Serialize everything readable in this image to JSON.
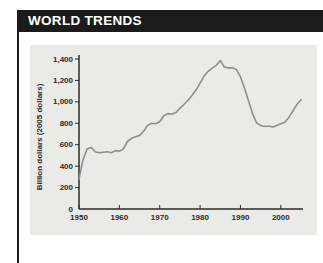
{
  "header": {
    "title": "WORLD TRENDS",
    "bg_color": "#1b1b1b",
    "text_color": "#ffffff"
  },
  "chart_data": {
    "type": "line",
    "title": "",
    "xlabel": "",
    "ylabel": "Billion dollars (2005 dollars)",
    "xlim": [
      1950,
      2005.5
    ],
    "ylim": [
      0,
      1400
    ],
    "grid": false,
    "legend": "none",
    "panel_bg": "#eaeae7",
    "axis_color": "#2e2b29",
    "line_color": "#8f8f8f",
    "x_ticks": [
      1950,
      1960,
      1970,
      1980,
      1990,
      2000
    ],
    "x_tick_labels": [
      "1950",
      "1960",
      "1970",
      "1980",
      "1990",
      "2000"
    ],
    "y_ticks": [
      0,
      200,
      400,
      600,
      800,
      1000,
      1200,
      1400
    ],
    "y_tick_labels": [
      "0",
      "200",
      "400",
      "600",
      "800",
      "1,000",
      "1,200",
      "1,400"
    ],
    "series": [
      {
        "name": "world-trend",
        "x": [
          1950,
          1951,
          1952,
          1953,
          1954,
          1955,
          1956,
          1957,
          1958,
          1959,
          1960,
          1961,
          1962,
          1963,
          1964,
          1965,
          1966,
          1967,
          1968,
          1969,
          1970,
          1971,
          1972,
          1973,
          1974,
          1975,
          1976,
          1977,
          1978,
          1979,
          1980,
          1981,
          1982,
          1983,
          1984,
          1985,
          1986,
          1987,
          1988,
          1989,
          1990,
          1991,
          1992,
          1993,
          1994,
          1995,
          1996,
          1997,
          1998,
          1999,
          2000,
          2001,
          2002,
          2003,
          2004,
          2005
        ],
        "y": [
          280,
          460,
          560,
          575,
          535,
          525,
          530,
          535,
          525,
          545,
          540,
          560,
          630,
          660,
          675,
          685,
          725,
          780,
          800,
          795,
          815,
          870,
          890,
          885,
          900,
          940,
          975,
          1015,
          1060,
          1110,
          1175,
          1240,
          1285,
          1315,
          1340,
          1385,
          1325,
          1315,
          1320,
          1300,
          1235,
          1130,
          1010,
          890,
          805,
          780,
          770,
          775,
          765,
          780,
          795,
          810,
          855,
          915,
          975,
          1020
        ]
      }
    ]
  }
}
